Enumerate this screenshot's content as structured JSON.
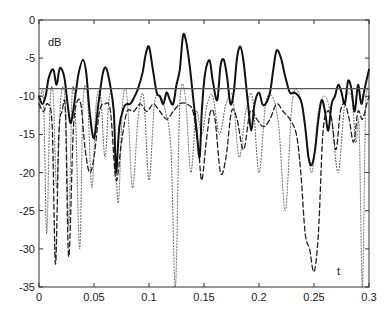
{
  "chart_data": {
    "type": "line",
    "title": "",
    "xlabel": "t",
    "ylabel": "dB",
    "xlim": [
      0,
      0.3
    ],
    "ylim": [
      -35,
      0
    ],
    "xticks": [
      0,
      0.05,
      0.1,
      0.15,
      0.2,
      0.25,
      0.3
    ],
    "xtick_labels": [
      "0",
      "0.05",
      "0.1",
      "0.15",
      "0.2",
      "0.25",
      "0.3"
    ],
    "yticks": [
      0,
      -5,
      -10,
      -15,
      -20,
      -25,
      -30,
      -35
    ],
    "ytick_labels": [
      "0",
      "-5",
      "-10",
      "-15",
      "-20",
      "-25",
      "-30",
      "-35"
    ],
    "grid": false,
    "legend": null,
    "threshold_line": {
      "y": -9,
      "color": "#555555"
    },
    "series": [
      {
        "name": "solid",
        "style": "solid",
        "color": "#111111",
        "width": 2,
        "x": [
          0,
          0.003,
          0.006,
          0.009,
          0.013,
          0.016,
          0.019,
          0.023,
          0.026,
          0.029,
          0.033,
          0.036,
          0.04,
          0.043,
          0.046,
          0.05,
          0.054,
          0.058,
          0.061,
          0.064,
          0.068,
          0.07,
          0.073,
          0.077,
          0.08,
          0.083,
          0.087,
          0.09,
          0.094,
          0.097,
          0.1,
          0.103,
          0.107,
          0.11,
          0.113,
          0.116,
          0.119,
          0.122,
          0.125,
          0.128,
          0.131,
          0.134,
          0.137,
          0.14,
          0.143,
          0.146,
          0.148,
          0.151,
          0.155,
          0.158,
          0.162,
          0.165,
          0.168,
          0.171,
          0.174,
          0.177,
          0.18,
          0.183,
          0.186,
          0.19,
          0.193,
          0.196,
          0.2,
          0.203,
          0.206,
          0.21,
          0.213,
          0.216,
          0.22,
          0.224,
          0.228,
          0.232,
          0.236,
          0.239,
          0.242,
          0.245,
          0.248,
          0.251,
          0.254,
          0.257,
          0.26,
          0.263,
          0.266,
          0.269,
          0.272,
          0.275,
          0.278,
          0.281,
          0.284,
          0.287,
          0.29,
          0.293,
          0.296,
          0.3
        ],
        "values": [
          -10,
          -11,
          -10,
          -7.5,
          -6.5,
          -8.5,
          -6.3,
          -7.5,
          -11,
          -13.5,
          -10,
          -7,
          -5.2,
          -7,
          -12,
          -15.5,
          -11,
          -7,
          -6.3,
          -8,
          -12,
          -20,
          -14,
          -11.5,
          -11,
          -11,
          -10,
          -9,
          -7,
          -4.5,
          -3.5,
          -6,
          -9.5,
          -10,
          -11,
          -9.5,
          -10.5,
          -11,
          -8.5,
          -6.5,
          -2,
          -3,
          -6,
          -10,
          -14,
          -18,
          -12,
          -7,
          -5.3,
          -8,
          -10.5,
          -6,
          -5.2,
          -7.5,
          -11,
          -9.5,
          -5,
          -3.5,
          -5.5,
          -11,
          -14.5,
          -11,
          -9.5,
          -11,
          -11,
          -9.5,
          -6.5,
          -4,
          -5,
          -7.5,
          -9.5,
          -9.5,
          -10,
          -11,
          -14,
          -18,
          -19,
          -17,
          -13,
          -10.5,
          -12,
          -14.5,
          -11,
          -10,
          -8.5,
          -9.5,
          -11,
          -8,
          -9,
          -12,
          -8.5,
          -11,
          -9,
          -6.5
        ]
      },
      {
        "name": "dashed",
        "style": "dashed",
        "color": "#222222",
        "width": 1.3,
        "x": [
          0,
          0.004,
          0.008,
          0.012,
          0.015,
          0.018,
          0.021,
          0.024,
          0.027,
          0.031,
          0.034,
          0.038,
          0.042,
          0.046,
          0.05,
          0.055,
          0.06,
          0.065,
          0.07,
          0.075,
          0.08,
          0.086,
          0.092,
          0.098,
          0.104,
          0.11,
          0.116,
          0.122,
          0.128,
          0.134,
          0.14,
          0.145,
          0.148,
          0.152,
          0.156,
          0.16,
          0.165,
          0.17,
          0.175,
          0.18,
          0.186,
          0.192,
          0.198,
          0.204,
          0.21,
          0.216,
          0.222,
          0.228,
          0.234,
          0.238,
          0.242,
          0.246,
          0.25,
          0.254,
          0.258,
          0.262,
          0.266,
          0.27,
          0.274,
          0.278,
          0.282,
          0.286,
          0.29,
          0.294,
          0.298,
          0.3
        ],
        "values": [
          -11,
          -12,
          -11,
          -14,
          -32,
          -15,
          -12,
          -12,
          -31,
          -15,
          -11,
          -11,
          -17,
          -20,
          -18,
          -12,
          -11,
          -12,
          -21,
          -16,
          -12,
          -12,
          -11,
          -12,
          -11,
          -12,
          -13,
          -12,
          -11,
          -11,
          -12,
          -17,
          -21,
          -16,
          -12,
          -13,
          -20,
          -18,
          -12,
          -13,
          -17,
          -12,
          -13,
          -14,
          -13,
          -11,
          -12,
          -13,
          -15,
          -20,
          -28,
          -30,
          -33,
          -28,
          -15,
          -12,
          -13,
          -17,
          -12,
          -11,
          -13,
          -16,
          -12,
          -13,
          -11,
          -10
        ]
      },
      {
        "name": "dotted",
        "style": "dotted",
        "color": "#555555",
        "width": 1,
        "x": [
          0,
          0.004,
          0.007,
          0.01,
          0.013,
          0.016,
          0.02,
          0.024,
          0.027,
          0.03,
          0.033,
          0.037,
          0.04,
          0.044,
          0.048,
          0.052,
          0.056,
          0.06,
          0.064,
          0.068,
          0.072,
          0.076,
          0.08,
          0.085,
          0.09,
          0.095,
          0.1,
          0.105,
          0.11,
          0.115,
          0.12,
          0.124,
          0.128,
          0.133,
          0.138,
          0.143,
          0.148,
          0.153,
          0.158,
          0.164,
          0.17,
          0.176,
          0.182,
          0.188,
          0.194,
          0.2,
          0.206,
          0.212,
          0.218,
          0.224,
          0.23,
          0.236,
          0.242,
          0.248,
          0.254,
          0.26,
          0.266,
          0.272,
          0.278,
          0.284,
          0.288,
          0.291,
          0.294,
          0.297,
          0.3
        ],
        "values": [
          -12,
          -10,
          -28,
          -11,
          -10,
          -22,
          -10,
          -11,
          -27,
          -10,
          -12,
          -30,
          -11,
          -10,
          -22,
          -11,
          -10,
          -18,
          -10,
          -12,
          -24,
          -11,
          -10,
          -22,
          -13,
          -10,
          -21,
          -11,
          -10,
          -12,
          -17,
          -35,
          -11,
          -10,
          -20,
          -12,
          -15,
          -11,
          -10,
          -15,
          -11,
          -10,
          -18,
          -12,
          -10,
          -20,
          -11,
          -10,
          -14,
          -25,
          -11,
          -9.5,
          -14,
          -20,
          -12,
          -10,
          -13,
          -20,
          -11,
          -10,
          -16,
          -14,
          -35,
          -11,
          -10
        ]
      }
    ]
  }
}
